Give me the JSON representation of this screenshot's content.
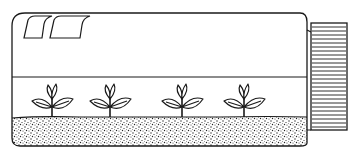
{
  "illustration": {
    "subject": "seedlings growing in a sealed bottle lying on its side",
    "colors": {
      "ink": "#1a1a1a",
      "background": "#ffffff",
      "soil_dot": "#222222"
    },
    "plants": [
      {
        "x": 52
      },
      {
        "x": 110
      },
      {
        "x": 182
      },
      {
        "x": 244
      }
    ],
    "labels": []
  }
}
